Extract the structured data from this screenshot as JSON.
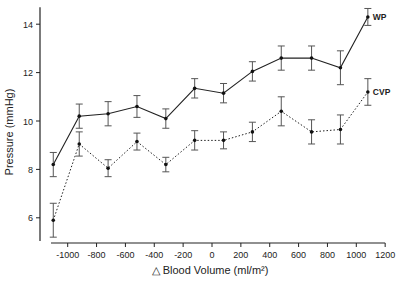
{
  "chart_data": {
    "type": "line",
    "title": "",
    "xlabel": "△ Blood Volume (ml/m²)",
    "ylabel": "Pressure (mmHg)",
    "xlim": [
      -1150,
      1200
    ],
    "ylim": [
      5,
      14.7
    ],
    "x_ticks": [
      -1000,
      -800,
      -600,
      -400,
      -200,
      0,
      200,
      400,
      600,
      800,
      1000,
      1200
    ],
    "y_ticks": [
      6,
      8,
      10,
      12,
      14
    ],
    "grid": false,
    "legend": "inline labels at right end of each series",
    "x": [
      -1100,
      -920,
      -720,
      -520,
      -320,
      -120,
      80,
      280,
      480,
      690,
      890,
      1080
    ],
    "series": [
      {
        "name": "WP",
        "style": "solid",
        "values": [
          8.2,
          10.2,
          10.3,
          10.6,
          10.1,
          11.35,
          11.15,
          12.05,
          12.6,
          12.6,
          12.2,
          14.3
        ],
        "error": [
          0.5,
          0.5,
          0.5,
          0.45,
          0.4,
          0.4,
          0.4,
          0.4,
          0.5,
          0.5,
          0.7,
          0.35
        ]
      },
      {
        "name": "CVP",
        "style": "dotted",
        "values": [
          5.9,
          9.05,
          8.05,
          9.15,
          8.2,
          9.2,
          9.2,
          9.55,
          10.4,
          9.55,
          9.65,
          11.2
        ],
        "error": [
          0.7,
          0.5,
          0.35,
          0.35,
          0.3,
          0.4,
          0.35,
          0.4,
          0.6,
          0.5,
          0.6,
          0.55
        ]
      }
    ]
  }
}
